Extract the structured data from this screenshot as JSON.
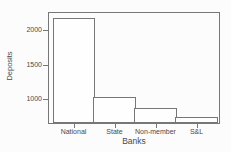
{
  "figure": {
    "background": "#fcfcfc",
    "axis_color": "#777777",
    "text_color": "#4a4a4a",
    "bar_fill": "#fefefe"
  },
  "chart_data": {
    "type": "bar",
    "categories": [
      "National",
      "State",
      "Non-member",
      "S&L"
    ],
    "values": [
      2170,
      1025,
      870,
      740
    ],
    "title": "",
    "xlabel": "Banks",
    "ylabel": "Deposits",
    "ylim": [
      650,
      2250
    ],
    "yticks": [
      1000,
      1500,
      2000
    ],
    "grid": false,
    "legend": false,
    "bar_gap": 0
  }
}
